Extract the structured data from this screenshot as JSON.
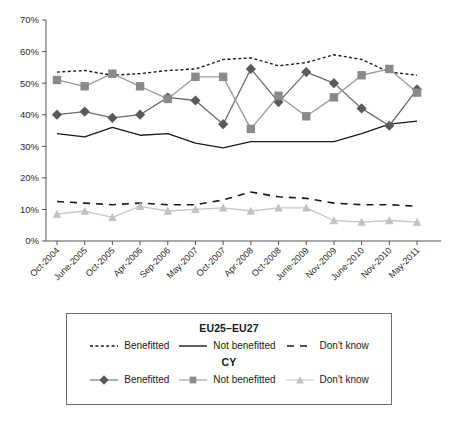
{
  "chart_data": {
    "type": "line",
    "title": "",
    "xlabel": "",
    "ylabel": "",
    "ylim": [
      0,
      70
    ],
    "ytick_labels": [
      "0%",
      "10%",
      "20%",
      "30%",
      "40%",
      "50%",
      "60%",
      "70%"
    ],
    "ytick_values": [
      0,
      10,
      20,
      30,
      40,
      50,
      60,
      70
    ],
    "grid": false,
    "legend_position": "below-plot",
    "categories": [
      "Oct-2004",
      "June-2005",
      "Oct-2005",
      "Apr-2006",
      "Sep-2006",
      "May-2007",
      "Oct-2007",
      "Apr-2008",
      "Oct-2008",
      "June-2009",
      "Nov-2009",
      "June-2010",
      "Nov-2010",
      "May-2011"
    ],
    "series": [
      {
        "name": "EU25-EU27 Benefitted",
        "group": "EU25-EU27",
        "label": "Benefitted",
        "style": "dotted",
        "color": "#1a1a1a",
        "marker": "none",
        "values": [
          53.5,
          54.0,
          52.5,
          53.0,
          54.0,
          54.5,
          57.5,
          58.0,
          55.5,
          56.5,
          59.0,
          57.5,
          53.5,
          52.5
        ]
      },
      {
        "name": "EU25-EU27 Not benefitted",
        "group": "EU25-EU27",
        "label": "Not benefitted",
        "style": "solid",
        "color": "#1a1a1a",
        "marker": "none",
        "values": [
          34.0,
          33.0,
          36.0,
          33.5,
          34.0,
          31.0,
          29.5,
          31.5,
          31.5,
          31.5,
          31.5,
          34.0,
          37.0,
          38.0
        ]
      },
      {
        "name": "EU25-EU27 Don't know",
        "group": "EU25-EU27",
        "label": "Don't know",
        "style": "dashed",
        "color": "#1a1a1a",
        "marker": "none",
        "values": [
          12.5,
          12.0,
          11.5,
          12.0,
          11.5,
          11.5,
          13.0,
          15.5,
          14.0,
          13.5,
          12.0,
          11.5,
          11.5,
          11.0
        ]
      },
      {
        "name": "CY Benefitted",
        "group": "CY",
        "label": "Benefitted",
        "style": "solid",
        "color": "#6b6b6b",
        "marker": "diamond",
        "marker_color": "#5a5a5a",
        "values": [
          40.0,
          41.0,
          39.0,
          40.0,
          45.5,
          44.5,
          37.0,
          54.5,
          44.0,
          53.5,
          50.0,
          42.0,
          36.5,
          48.0
        ]
      },
      {
        "name": "CY Not benefitted",
        "group": "CY",
        "label": "Not benefitted",
        "style": "solid",
        "color": "#9b9b9b",
        "marker": "square",
        "marker_color": "#8a8a8a",
        "values": [
          51.0,
          49.0,
          53.0,
          49.0,
          45.0,
          52.0,
          52.0,
          35.5,
          46.0,
          39.5,
          45.5,
          52.5,
          54.5,
          47.0
        ]
      },
      {
        "name": "CY Don't know",
        "group": "CY",
        "label": "Don't know",
        "style": "solid",
        "color": "#c6c6c6",
        "marker": "triangle",
        "marker_color": "#c2c2c2",
        "values": [
          8.5,
          9.5,
          7.5,
          11.0,
          9.5,
          10.0,
          10.5,
          9.5,
          10.5,
          10.5,
          6.5,
          6.0,
          6.5,
          6.0
        ]
      }
    ]
  },
  "legend": {
    "group1_title": "EU25–EU27",
    "group2_title": "CY",
    "eu_benefitted": "Benefitted",
    "eu_not_benefitted": "Not benefitted",
    "eu_dont_know": "Don't know",
    "cy_benefitted": "Benefitted",
    "cy_not_benefitted": "Not benefitted",
    "cy_dont_know": "Don't know"
  },
  "axis": {
    "y_labels": [
      "70%",
      "60%",
      "50%",
      "40%",
      "30%",
      "20%",
      "10%",
      "0%"
    ]
  }
}
